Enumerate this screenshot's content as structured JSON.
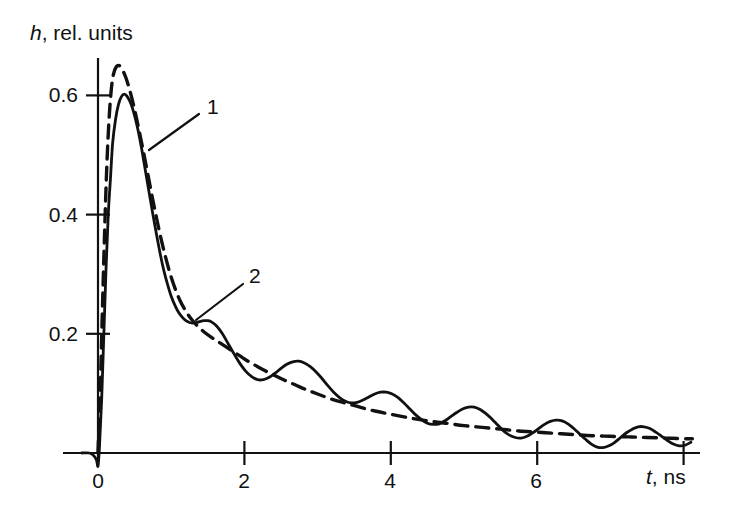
{
  "chart_data": {
    "type": "line",
    "title": "",
    "xlabel": "t, ns",
    "ylabel": "h, rel. units",
    "xlabel_symbol": "t",
    "xlabel_rest": ", ns",
    "ylabel_symbol": "h",
    "ylabel_rest": ", rel. units",
    "xlim": [
      -0.25,
      8.15
    ],
    "ylim": [
      -0.035,
      0.7
    ],
    "grid": false,
    "legend_position": "inline-leader-labels",
    "xticks": [
      0,
      2,
      4,
      6
    ],
    "xtick_labels": [
      "0",
      "2",
      "4",
      "6"
    ],
    "xticks_unlabeled": [
      8
    ],
    "yticks": [
      0.2,
      0.4,
      0.6
    ],
    "ytick_labels": [
      "0.2",
      "0.4",
      "0.6"
    ],
    "annotations": [
      {
        "name": "curve-1-callout",
        "text": "1",
        "label_x": 207,
        "label_y": 96,
        "leader_from_x": 199,
        "leader_from_y": 114,
        "leader_to_x": 149,
        "leader_to_y": 150
      },
      {
        "name": "curve-2-callout",
        "text": "2",
        "label_x": 249,
        "label_y": 265,
        "leader_from_x": 243,
        "leader_from_y": 284,
        "leader_to_x": 196,
        "leader_to_y": 320
      }
    ],
    "series": [
      {
        "name": "1",
        "style": "solid",
        "color": "#111111",
        "points": [
          [
            -0.22,
            0.0
          ],
          [
            -0.12,
            0.0
          ],
          [
            -0.06,
            -0.004
          ],
          [
            -0.02,
            -0.012
          ],
          [
            0.0,
            -0.022
          ],
          [
            0.02,
            0.01
          ],
          [
            0.05,
            0.09
          ],
          [
            0.08,
            0.2
          ],
          [
            0.11,
            0.31
          ],
          [
            0.14,
            0.4
          ],
          [
            0.17,
            0.46
          ],
          [
            0.2,
            0.52
          ],
          [
            0.24,
            0.56
          ],
          [
            0.28,
            0.585
          ],
          [
            0.32,
            0.598
          ],
          [
            0.36,
            0.602
          ],
          [
            0.4,
            0.598
          ],
          [
            0.45,
            0.586
          ],
          [
            0.5,
            0.566
          ],
          [
            0.55,
            0.54
          ],
          [
            0.6,
            0.508
          ],
          [
            0.65,
            0.472
          ],
          [
            0.7,
            0.436
          ],
          [
            0.75,
            0.4
          ],
          [
            0.8,
            0.366
          ],
          [
            0.85,
            0.334
          ],
          [
            0.9,
            0.306
          ],
          [
            0.95,
            0.283
          ],
          [
            1.0,
            0.263
          ],
          [
            1.05,
            0.248
          ],
          [
            1.1,
            0.236
          ],
          [
            1.15,
            0.228
          ],
          [
            1.2,
            0.222
          ],
          [
            1.25,
            0.219
          ],
          [
            1.3,
            0.218
          ],
          [
            1.35,
            0.219
          ],
          [
            1.4,
            0.221
          ],
          [
            1.45,
            0.222
          ],
          [
            1.5,
            0.222
          ],
          [
            1.55,
            0.22
          ],
          [
            1.62,
            0.213
          ],
          [
            1.7,
            0.2
          ],
          [
            1.78,
            0.183
          ],
          [
            1.86,
            0.166
          ],
          [
            1.94,
            0.15
          ],
          [
            2.02,
            0.137
          ],
          [
            2.1,
            0.128
          ],
          [
            2.18,
            0.123
          ],
          [
            2.26,
            0.123
          ],
          [
            2.34,
            0.127
          ],
          [
            2.42,
            0.134
          ],
          [
            2.5,
            0.142
          ],
          [
            2.58,
            0.149
          ],
          [
            2.66,
            0.153
          ],
          [
            2.74,
            0.154
          ],
          [
            2.82,
            0.151
          ],
          [
            2.9,
            0.145
          ],
          [
            2.98,
            0.136
          ],
          [
            3.06,
            0.125
          ],
          [
            3.14,
            0.113
          ],
          [
            3.22,
            0.102
          ],
          [
            3.3,
            0.093
          ],
          [
            3.38,
            0.087
          ],
          [
            3.46,
            0.084
          ],
          [
            3.54,
            0.085
          ],
          [
            3.62,
            0.089
          ],
          [
            3.7,
            0.094
          ],
          [
            3.78,
            0.099
          ],
          [
            3.86,
            0.102
          ],
          [
            3.94,
            0.102
          ],
          [
            4.02,
            0.099
          ],
          [
            4.1,
            0.093
          ],
          [
            4.18,
            0.084
          ],
          [
            4.26,
            0.074
          ],
          [
            4.34,
            0.064
          ],
          [
            4.42,
            0.056
          ],
          [
            4.5,
            0.05
          ],
          [
            4.58,
            0.048
          ],
          [
            4.66,
            0.049
          ],
          [
            4.74,
            0.054
          ],
          [
            4.82,
            0.061
          ],
          [
            4.9,
            0.068
          ],
          [
            4.98,
            0.074
          ],
          [
            5.06,
            0.077
          ],
          [
            5.14,
            0.077
          ],
          [
            5.22,
            0.073
          ],
          [
            5.3,
            0.066
          ],
          [
            5.38,
            0.057
          ],
          [
            5.46,
            0.047
          ],
          [
            5.54,
            0.037
          ],
          [
            5.62,
            0.03
          ],
          [
            5.7,
            0.026
          ],
          [
            5.78,
            0.025
          ],
          [
            5.86,
            0.028
          ],
          [
            5.94,
            0.034
          ],
          [
            6.02,
            0.041
          ],
          [
            6.1,
            0.048
          ],
          [
            6.18,
            0.053
          ],
          [
            6.26,
            0.055
          ],
          [
            6.34,
            0.054
          ],
          [
            6.42,
            0.049
          ],
          [
            6.5,
            0.041
          ],
          [
            6.58,
            0.032
          ],
          [
            6.66,
            0.023
          ],
          [
            6.74,
            0.015
          ],
          [
            6.82,
            0.01
          ],
          [
            6.9,
            0.009
          ],
          [
            6.98,
            0.012
          ],
          [
            7.06,
            0.018
          ],
          [
            7.14,
            0.026
          ],
          [
            7.22,
            0.034
          ],
          [
            7.3,
            0.04
          ],
          [
            7.38,
            0.044
          ],
          [
            7.46,
            0.044
          ],
          [
            7.54,
            0.041
          ],
          [
            7.62,
            0.035
          ],
          [
            7.7,
            0.028
          ],
          [
            7.78,
            0.021
          ],
          [
            7.86,
            0.015
          ],
          [
            7.94,
            0.012
          ],
          [
            8.02,
            0.013
          ],
          [
            8.1,
            0.018
          ]
        ]
      },
      {
        "name": "2",
        "style": "dashed",
        "color": "#111111",
        "dash_pattern": "13,8",
        "points": [
          [
            0.0,
            0.0
          ],
          [
            0.03,
            0.1
          ],
          [
            0.06,
            0.24
          ],
          [
            0.09,
            0.37
          ],
          [
            0.12,
            0.48
          ],
          [
            0.15,
            0.558
          ],
          [
            0.18,
            0.608
          ],
          [
            0.21,
            0.635
          ],
          [
            0.25,
            0.648
          ],
          [
            0.29,
            0.65
          ],
          [
            0.33,
            0.644
          ],
          [
            0.38,
            0.63
          ],
          [
            0.44,
            0.606
          ],
          [
            0.5,
            0.576
          ],
          [
            0.56,
            0.542
          ],
          [
            0.62,
            0.506
          ],
          [
            0.68,
            0.468
          ],
          [
            0.74,
            0.43
          ],
          [
            0.8,
            0.394
          ],
          [
            0.86,
            0.36
          ],
          [
            0.92,
            0.33
          ],
          [
            0.98,
            0.303
          ],
          [
            1.05,
            0.277
          ],
          [
            1.12,
            0.256
          ],
          [
            1.2,
            0.238
          ],
          [
            1.28,
            0.224
          ],
          [
            1.36,
            0.213
          ],
          [
            1.45,
            0.203
          ],
          [
            1.55,
            0.194
          ],
          [
            1.65,
            0.186
          ],
          [
            1.75,
            0.178
          ],
          [
            1.85,
            0.17
          ],
          [
            1.95,
            0.162
          ],
          [
            2.05,
            0.154
          ],
          [
            2.15,
            0.147
          ],
          [
            2.25,
            0.14
          ],
          [
            2.4,
            0.131
          ],
          [
            2.55,
            0.122
          ],
          [
            2.7,
            0.114
          ],
          [
            2.85,
            0.106
          ],
          [
            3.0,
            0.099
          ],
          [
            3.2,
            0.09
          ],
          [
            3.4,
            0.083
          ],
          [
            3.6,
            0.076
          ],
          [
            3.8,
            0.07
          ],
          [
            4.0,
            0.065
          ],
          [
            4.25,
            0.059
          ],
          [
            4.5,
            0.054
          ],
          [
            4.75,
            0.05
          ],
          [
            5.0,
            0.046
          ],
          [
            5.25,
            0.043
          ],
          [
            5.5,
            0.04
          ],
          [
            5.75,
            0.037
          ],
          [
            6.0,
            0.035
          ],
          [
            6.25,
            0.033
          ],
          [
            6.5,
            0.031
          ],
          [
            6.75,
            0.029
          ],
          [
            7.0,
            0.028
          ],
          [
            7.25,
            0.027
          ],
          [
            7.5,
            0.026
          ],
          [
            7.75,
            0.025
          ],
          [
            8.0,
            0.024
          ],
          [
            8.12,
            0.024
          ]
        ]
      }
    ],
    "axis_geometry": {
      "origin_x": 98,
      "origin_y": 453,
      "px_per_ns": 73.2,
      "px_per_unit_y": 596,
      "x_axis_left": 63,
      "x_axis_right": 700,
      "y_axis_top": 58
    }
  }
}
